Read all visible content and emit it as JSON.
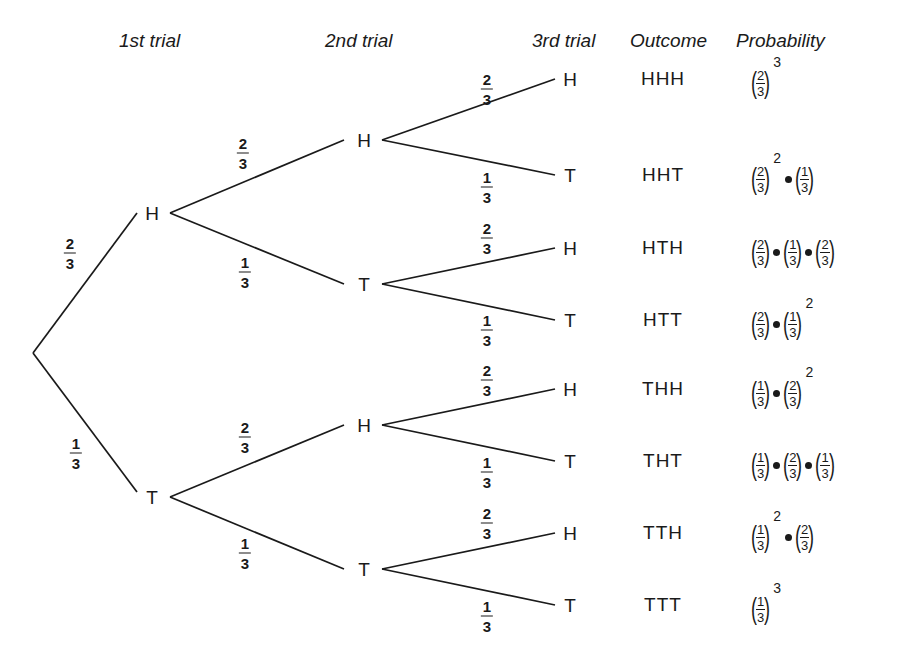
{
  "headers": {
    "trial1": "1st trial",
    "trial2": "2nd trial",
    "trial3": "3rd trial",
    "outcome": "Outcome",
    "probability": "Probability"
  },
  "root": {
    "x": 33,
    "y": 353
  },
  "level1": [
    {
      "label": "H",
      "x": 152,
      "y": 213,
      "prob": {
        "num": "2",
        "den": "3"
      },
      "label_x": 70,
      "label_y": 253
    },
    {
      "label": "T",
      "x": 152,
      "y": 497,
      "prob": {
        "num": "1",
        "den": "3"
      },
      "label_x": 76,
      "label_y": 453
    }
  ],
  "level2": [
    {
      "label": "H",
      "x": 364,
      "y": 140,
      "parent": 0,
      "prob": {
        "num": "2",
        "den": "3"
      },
      "label_x": 243,
      "label_y": 153
    },
    {
      "label": "T",
      "x": 364,
      "y": 284,
      "parent": 0,
      "prob": {
        "num": "1",
        "den": "3"
      },
      "label_x": 245,
      "label_y": 272
    },
    {
      "label": "H",
      "x": 364,
      "y": 425,
      "parent": 1,
      "prob": {
        "num": "2",
        "den": "3"
      },
      "label_x": 245,
      "label_y": 437
    },
    {
      "label": "T",
      "x": 364,
      "y": 569,
      "parent": 1,
      "prob": {
        "num": "1",
        "den": "3"
      },
      "label_x": 245,
      "label_y": 553
    }
  ],
  "level3": [
    {
      "label": "H",
      "y": 79,
      "parent": 0,
      "prob": {
        "num": "2",
        "den": "3"
      },
      "label_y": 89
    },
    {
      "label": "T",
      "y": 175,
      "parent": 0,
      "prob": {
        "num": "1",
        "den": "3"
      },
      "label_y": 187
    },
    {
      "label": "H",
      "y": 248,
      "parent": 1,
      "prob": {
        "num": "2",
        "den": "3"
      },
      "label_y": 238
    },
    {
      "label": "T",
      "y": 320,
      "parent": 1,
      "prob": {
        "num": "1",
        "den": "3"
      },
      "label_y": 330
    },
    {
      "label": "H",
      "y": 389,
      "parent": 2,
      "prob": {
        "num": "2",
        "den": "3"
      },
      "label_y": 380
    },
    {
      "label": "T",
      "y": 461,
      "parent": 2,
      "prob": {
        "num": "1",
        "den": "3"
      },
      "label_y": 472
    },
    {
      "label": "H",
      "y": 533,
      "parent": 3,
      "prob": {
        "num": "2",
        "den": "3"
      },
      "label_y": 523
    },
    {
      "label": "T",
      "y": 605,
      "parent": 3,
      "prob": {
        "num": "1",
        "den": "3"
      },
      "label_y": 616
    }
  ],
  "rows": [
    {
      "outcome": "HHH",
      "probability": [
        {
          "f": [
            "2",
            "3"
          ],
          "exp": "3"
        }
      ]
    },
    {
      "outcome": "HHT",
      "probability": [
        {
          "f": [
            "2",
            "3"
          ],
          "exp": "2"
        },
        {
          "f": [
            "1",
            "3"
          ]
        }
      ]
    },
    {
      "outcome": "HTH",
      "probability": [
        {
          "f": [
            "2",
            "3"
          ]
        },
        {
          "f": [
            "1",
            "3"
          ]
        },
        {
          "f": [
            "2",
            "3"
          ]
        }
      ]
    },
    {
      "outcome": "HTT",
      "probability": [
        {
          "f": [
            "2",
            "3"
          ]
        },
        {
          "f": [
            "1",
            "3"
          ],
          "exp": "2"
        }
      ]
    },
    {
      "outcome": "THH",
      "probability": [
        {
          "f": [
            "1",
            "3"
          ]
        },
        {
          "f": [
            "2",
            "3"
          ],
          "exp": "2"
        }
      ]
    },
    {
      "outcome": "THT",
      "probability": [
        {
          "f": [
            "1",
            "3"
          ]
        },
        {
          "f": [
            "2",
            "3"
          ]
        },
        {
          "f": [
            "1",
            "3"
          ]
        }
      ]
    },
    {
      "outcome": "TTH",
      "probability": [
        {
          "f": [
            "1",
            "3"
          ],
          "exp": "2"
        },
        {
          "f": [
            "2",
            "3"
          ]
        }
      ]
    },
    {
      "outcome": "TTT",
      "probability": [
        {
          "f": [
            "1",
            "3"
          ],
          "exp": "3"
        }
      ]
    }
  ]
}
